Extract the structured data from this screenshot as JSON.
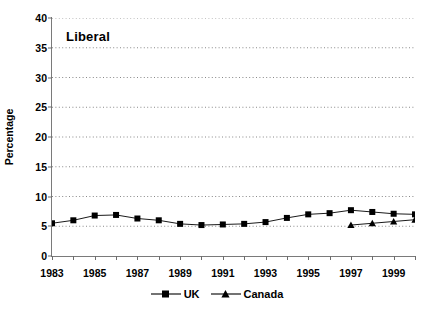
{
  "chart_data": {
    "type": "line",
    "title": "Liberal",
    "xlabel": "",
    "ylabel": "Percentage",
    "ylim": [
      0,
      40
    ],
    "ytick_step": 5,
    "yticks": [
      0,
      5,
      10,
      15,
      20,
      25,
      30,
      35,
      40
    ],
    "xlim": [
      1983,
      2000
    ],
    "xticks_labeled": [
      1983,
      1985,
      1987,
      1989,
      1991,
      1993,
      1995,
      1997,
      1999
    ],
    "x": [
      1983,
      1984,
      1985,
      1986,
      1987,
      1988,
      1989,
      1990,
      1991,
      1992,
      1993,
      1994,
      1995,
      1996,
      1997,
      1998,
      1999,
      2000
    ],
    "grid": "horizontal-dotted",
    "legend_position": "bottom-center",
    "series": [
      {
        "name": "UK",
        "marker": "square",
        "color": "#000000",
        "x": [
          1983,
          1984,
          1985,
          1986,
          1987,
          1988,
          1989,
          1990,
          1991,
          1992,
          1993,
          1994,
          1995,
          1996,
          1997,
          1998,
          1999,
          2000
        ],
        "values": [
          5.5,
          6.0,
          6.8,
          6.9,
          6.3,
          6.0,
          5.4,
          5.2,
          5.3,
          5.4,
          5.7,
          6.4,
          7.0,
          7.2,
          7.7,
          7.4,
          7.1,
          7.0
        ]
      },
      {
        "name": "Canada",
        "marker": "triangle",
        "color": "#000000",
        "x": [
          1997,
          1998,
          1999,
          2000
        ],
        "values": [
          5.2,
          5.5,
          5.8,
          6.1
        ]
      }
    ]
  },
  "legend": {
    "items": [
      {
        "label": "UK",
        "marker": "square"
      },
      {
        "label": "Canada",
        "marker": "triangle"
      }
    ]
  }
}
